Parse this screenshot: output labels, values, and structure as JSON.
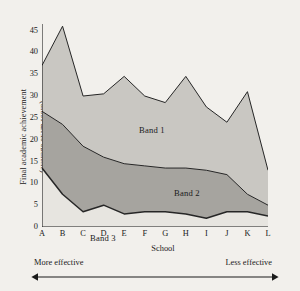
{
  "chart_data": {
    "type": "area",
    "title": "",
    "xlabel": "School",
    "ylabel": "Final academic achievement\n(average exam score)",
    "ylim": [
      0,
      46.5
    ],
    "yticks": [
      0,
      5,
      10,
      15,
      20,
      25,
      30,
      35,
      40,
      45
    ],
    "grid": false,
    "legend_position": "inline-annotations",
    "categories": [
      "A",
      "B",
      "C",
      "D",
      "E",
      "F",
      "G",
      "H",
      "I",
      "J",
      "K",
      "L"
    ],
    "stacked": false,
    "boundaries": {
      "top_of_band1": [
        37.0,
        46.0,
        30.0,
        30.5,
        34.5,
        30.0,
        28.5,
        34.5,
        27.5,
        24.0,
        31.0,
        13.0
      ],
      "top_of_band2": [
        26.5,
        23.5,
        18.5,
        16.0,
        14.5,
        14.0,
        13.5,
        13.5,
        13.0,
        12.0,
        7.5,
        5.0
      ],
      "top_of_band3": [
        13.5,
        7.5,
        3.5,
        5.0,
        3.0,
        3.5,
        3.5,
        3.0,
        2.0,
        3.5,
        3.5,
        2.5
      ]
    },
    "series": [
      {
        "name": "Band 1",
        "color": "#c9c7c2",
        "values": [
          10.5,
          22.5,
          11.5,
          14.5,
          20.0,
          16.0,
          15.0,
          21.0,
          14.5,
          12.0,
          23.5,
          8.0
        ]
      },
      {
        "name": "Band 2",
        "color": "#a6a49f",
        "values": [
          13.0,
          16.0,
          15.0,
          11.0,
          11.5,
          10.5,
          10.0,
          10.5,
          11.0,
          8.5,
          4.0,
          2.5
        ]
      },
      {
        "name": "Band 3",
        "color": "#e7e5e0",
        "values": [
          13.5,
          7.5,
          3.5,
          5.0,
          3.0,
          3.5,
          3.5,
          3.0,
          2.0,
          3.5,
          3.5,
          2.5
        ]
      }
    ],
    "annotations": [
      {
        "text": "Band 1",
        "x": "D",
        "y": 31
      },
      {
        "text": "Band 2",
        "x": "F",
        "y": 15
      },
      {
        "text": "Band 3",
        "x": "A",
        "y": 3
      }
    ],
    "axis_notes": {
      "left_note": "More effective",
      "right_note": "Less effective"
    },
    "colors": {
      "band1": "#c9c7c2",
      "band2": "#a6a49f",
      "band3": "#e7e5e0",
      "background": "#f2f0ec",
      "axis": "#1a1a1a",
      "line": "#262626"
    }
  },
  "labels": {
    "y_axis_title_line1": "Final academic achievement",
    "y_axis_title_line2": "(average exam score)",
    "x_axis_title": "School",
    "band1": "Band 1",
    "band2": "Band 2",
    "band3": "Band 3",
    "more_effective": "More effective",
    "less_effective": "Less effective"
  },
  "yticklabels": [
    "0",
    "5",
    "10",
    "15",
    "20",
    "25",
    "30",
    "35",
    "40",
    "45"
  ],
  "xticklabels": [
    "A",
    "B",
    "C",
    "D",
    "E",
    "F",
    "G",
    "H",
    "I",
    "J",
    "K",
    "L"
  ]
}
